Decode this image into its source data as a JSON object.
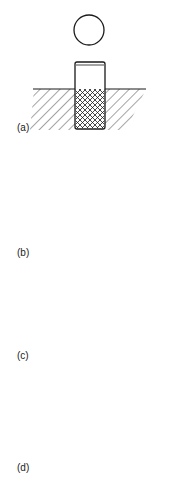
{
  "diagram": {
    "type": "technical-drawing",
    "line_color": "#1a1a1a",
    "background": "#ffffff",
    "panels": [
      {
        "id": "a",
        "label": "(a)",
        "plan_view": "circle",
        "section": "knurled cylindrical insert partially embedded in hatched material"
      },
      {
        "id": "b",
        "label": "(b)",
        "plan_view": "rectangular bar with dashed hidden lines",
        "section": "chamfered block with cross hole embedded in hatched material"
      },
      {
        "id": "c",
        "label": "(c)",
        "plan_view": "hexagon with concentric circles",
        "section": "internally threaded insert flush with hatched material surface"
      },
      {
        "id": "d",
        "label": "(d)",
        "plan_view": "concentric circles (ring)",
        "section": "through-hole threaded sleeve in hatched plate"
      }
    ]
  }
}
